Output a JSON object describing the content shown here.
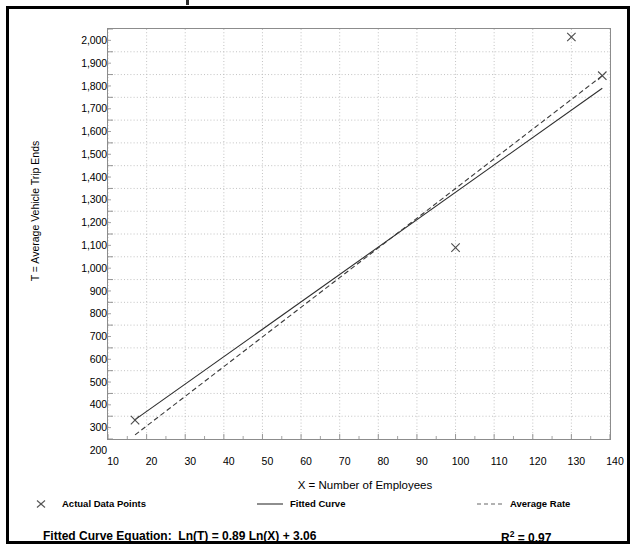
{
  "chart_data": {
    "type": "scatter",
    "title": "",
    "xlabel": "X = Number of Employees",
    "ylabel": "T = Average Vehicle Trip Ends",
    "xlim": [
      10,
      140
    ],
    "ylim": [
      200,
      2000
    ],
    "xticks": [
      "10",
      "20",
      "30",
      "40",
      "50",
      "60",
      "70",
      "80",
      "90",
      "100",
      "110",
      "120",
      "130",
      "140"
    ],
    "yticks": [
      "2,000",
      "1,900",
      "1,800",
      "1,700",
      "1,600",
      "1,500",
      "1,400",
      "1,300",
      "1,200",
      "1,100",
      "1,000",
      "900",
      "800",
      "700",
      "600",
      "500",
      "400",
      "300",
      "200"
    ],
    "grid": true,
    "legend_position": "below-axis",
    "series": [
      {
        "name": "Actual Data Points",
        "type": "scatter",
        "marker": "x",
        "points": [
          {
            "x": 17,
            "y": 283
          },
          {
            "x": 100,
            "y": 1040
          },
          {
            "x": 130,
            "y": 1965
          },
          {
            "x": 138,
            "y": 1795
          }
        ]
      },
      {
        "name": "Fitted Curve",
        "type": "line",
        "style": "solid",
        "equation": "Ln(T) = 0.89 Ln(X) + 3.06",
        "points": [
          {
            "x": 17,
            "y": 285
          },
          {
            "x": 138,
            "y": 1740
          }
        ]
      },
      {
        "name": "Average Rate",
        "type": "line",
        "style": "dashed",
        "points": [
          {
            "x": 17,
            "y": 218
          },
          {
            "x": 138,
            "y": 1795
          }
        ]
      }
    ]
  },
  "legend": {
    "items": [
      {
        "label": "Actual Data Points",
        "symbol": "x-marker"
      },
      {
        "label": "Fitted Curve",
        "symbol": "solid-line"
      },
      {
        "label": "Average Rate",
        "symbol": "dashed-line"
      }
    ]
  },
  "footer": {
    "equation_label": "Fitted Curve Equation:",
    "equation_value": "Ln(T) = 0.89 Ln(X) + 3.06",
    "r2_prefix": "R",
    "r2_sup": "2",
    "r2_value": " = 0.97"
  },
  "colors": {
    "ink": "#000000",
    "grid": "#b4b4b4",
    "axis": "#8c8c8c",
    "frame": "#000000"
  }
}
